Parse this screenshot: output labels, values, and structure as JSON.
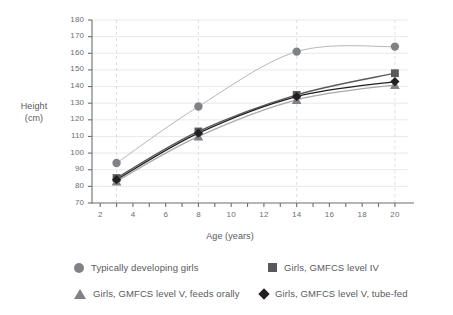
{
  "chart_data": {
    "type": "line",
    "title": "",
    "xlabel": "Age (years)",
    "ylabel": "Height (cm)",
    "ylabel_line1": "Height",
    "ylabel_line2": "(cm)",
    "xlim": [
      1.5,
      20.8
    ],
    "ylim": [
      70,
      180
    ],
    "grid": "horizontal gridlines at every 10 cm; dashed vertical gridlines at x = 3, 8, 14, 20",
    "legend_position": "below plot, two columns by two rows",
    "x": [
      3,
      8,
      14,
      20
    ],
    "xticks": [
      2,
      3,
      4,
      5,
      6,
      7,
      8,
      9,
      10,
      11,
      12,
      13,
      14,
      15,
      16,
      17,
      18,
      19,
      20
    ],
    "xtick_labels": [
      "2",
      "4",
      "6",
      "8",
      "10",
      "12",
      "14",
      "16",
      "18",
      "20"
    ],
    "xtick_label_values": [
      2,
      4,
      6,
      8,
      10,
      12,
      14,
      16,
      18,
      20
    ],
    "yticks": [
      70,
      80,
      90,
      100,
      110,
      120,
      130,
      140,
      150,
      160,
      170,
      180
    ],
    "ytick_labels": [
      "70",
      "80",
      "90",
      "100",
      "110",
      "120",
      "130",
      "140",
      "150",
      "160",
      "170",
      "180"
    ],
    "series": [
      {
        "name": "Typically developing girls",
        "marker": "circle",
        "color": "#808285",
        "line_color": "#b4b6b8",
        "values": [
          94,
          128,
          161,
          164
        ]
      },
      {
        "name": "Girls, GMFCS level IV",
        "marker": "square",
        "color": "#58595b",
        "line_color": "#58595b",
        "values": [
          85,
          113,
          135,
          148
        ]
      },
      {
        "name": "Girls, GMFCS level V, feeds orally",
        "marker": "triangle",
        "color": "#808285",
        "line_color": "#a7a9ac",
        "values": [
          83,
          110,
          132,
          141
        ]
      },
      {
        "name": "Girls, GMFCS level V, tube-fed",
        "marker": "diamond",
        "color": "#231f20",
        "line_color": "#231f20",
        "values": [
          84,
          112,
          134,
          143
        ]
      }
    ]
  },
  "legend": {
    "items": [
      {
        "label": "Typically developing girls",
        "marker": "circle-marker",
        "color": "#808285"
      },
      {
        "label": "Girls, GMFCS level IV",
        "marker": "square-marker",
        "color": "#58595b"
      },
      {
        "label": "Girls, GMFCS level V, feeds orally",
        "marker": "triangle-marker",
        "color": "#808285"
      },
      {
        "label": "Girls, GMFCS level V, tube-fed",
        "marker": "diamond-marker",
        "color": "#231f20"
      }
    ]
  }
}
